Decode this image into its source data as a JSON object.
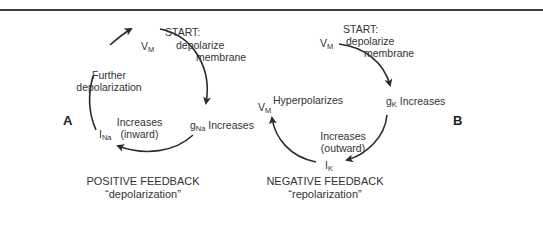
{
  "panel_a": {
    "label": "A",
    "start_title": "START:",
    "start_line1": "depolarize",
    "start_line2": "membrane",
    "node_top": {
      "main": "V",
      "sub": "M"
    },
    "node_right": {
      "main": "g",
      "sub": "Na",
      "text": "Increases"
    },
    "node_left": {
      "main": "I",
      "sub": "Na"
    },
    "inner_line1": "Increases",
    "inner_line2": "(inward)",
    "side_line1": "Further",
    "side_line2": "depolarization",
    "caption_line1": "POSITIVE FEEDBACK",
    "caption_line2": "“depolarization”"
  },
  "panel_b": {
    "label": "B",
    "start_title": "START:",
    "start_line1": "depolarize",
    "start_line2": "membrane",
    "node_top": {
      "main": "V",
      "sub": "M"
    },
    "node_right": {
      "main": "g",
      "sub": "K",
      "text": "Increases"
    },
    "node_bottom": {
      "main": "I",
      "sub": "K"
    },
    "node_left": {
      "main": "V",
      "sub": "M"
    },
    "left_text": "Hyperpolarizes",
    "inner_line1": "Increases",
    "inner_line2": "(outward)",
    "caption_line1": "NEGATIVE FEEDBACK",
    "caption_line2": "“repolarization”"
  }
}
